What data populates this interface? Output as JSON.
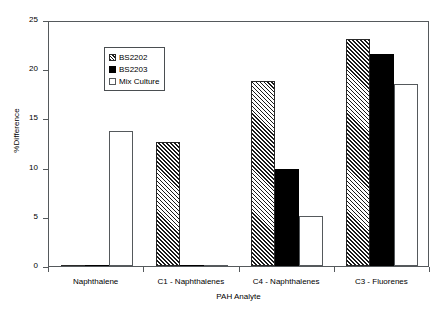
{
  "chart_data": {
    "type": "bar",
    "title": "",
    "xlabel": "PAH Analyte",
    "ylabel": "%Difference",
    "categories": [
      "Naphthalene",
      "C1 - Naphthalenes",
      "C4 - Naphthalenes",
      "C3 - Fluorenes"
    ],
    "series": [
      {
        "name": "BS2202",
        "style": "hatch",
        "values": [
          0,
          12.6,
          18.8,
          23.1
        ]
      },
      {
        "name": "BS2203",
        "style": "solid",
        "values": [
          0,
          0,
          9.9,
          21.5
        ]
      },
      {
        "name": "Mix Culture",
        "style": "open",
        "values": [
          13.7,
          0,
          5.1,
          18.5
        ]
      }
    ],
    "ylim": [
      0,
      25
    ],
    "yticks": [
      0,
      5,
      10,
      15,
      20,
      25
    ],
    "grid": false,
    "legend_position": "top-left",
    "colors": {
      "axis": "#55595c",
      "bar_outline": "#2a2a2a",
      "solid_fill": "#000000",
      "open_fill": "#ffffff",
      "background": "#ffffff"
    }
  }
}
